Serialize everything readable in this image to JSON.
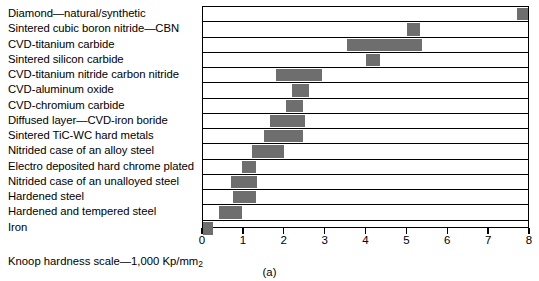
{
  "chart_data": {
    "type": "bar",
    "orientation": "horizontal-range",
    "title": "",
    "subtitle": "",
    "xlabel": "Knoop hardness scale—1,000 Kp/mm2",
    "ylabel": "",
    "xlim": [
      0,
      8
    ],
    "xticks": [
      0,
      1,
      2,
      3,
      4,
      5,
      6,
      7,
      8
    ],
    "xtick_labels": [
      "0",
      "1",
      "2",
      "3",
      "4",
      "5",
      "6",
      "7",
      "8"
    ],
    "grid": true,
    "legend": false,
    "bar_color": "#6e6e6e",
    "categories": [
      "Diamond—natural/synthetic",
      "Sintered cubic boron nitride—CBN",
      "CVD-titanium carbide",
      "Sintered silicon carbide",
      "CVD-titanium nitride carbon nitride",
      "CVD-aluminum oxide",
      "CVD-chromium carbide",
      "Diffused layer—CVD-iron boride",
      "Sintered TiC-WC hard metals",
      "Nitrided case of an alloy steel",
      "Electro deposited hard chrome plated",
      "Nitrided case of an unalloyed steel",
      "Hardened steel",
      "Hardened and tempered steel",
      "Iron"
    ],
    "ranges": [
      [
        7.72,
        8.0
      ],
      [
        5.02,
        5.35
      ],
      [
        3.55,
        5.4
      ],
      [
        4.0,
        4.35
      ],
      [
        1.8,
        2.92
      ],
      [
        2.2,
        2.6
      ],
      [
        2.05,
        2.45
      ],
      [
        1.65,
        2.5
      ],
      [
        1.5,
        2.45
      ],
      [
        1.2,
        2.0
      ],
      [
        0.95,
        1.3
      ],
      [
        0.7,
        1.32
      ],
      [
        0.75,
        1.3
      ],
      [
        0.4,
        0.95
      ],
      [
        0.0,
        0.25
      ]
    ],
    "annotations": [
      "(a)"
    ]
  },
  "figure": {
    "scale_caption_prefix": "Knoop hardness scale—1,000 Kp/mm",
    "scale_caption_sub": "2",
    "figure_label": "(a)"
  }
}
